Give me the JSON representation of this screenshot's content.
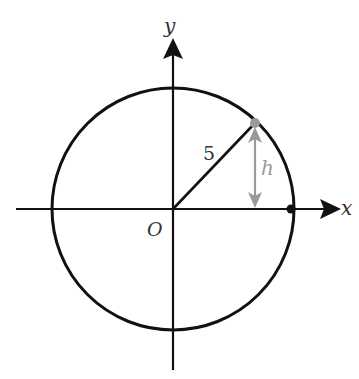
{
  "diagram": {
    "type": "unit-circle-height",
    "origin_label": "O",
    "x_axis_label": "x",
    "y_axis_label": "y",
    "radius_label": "5",
    "height_label": "h",
    "colors": {
      "stroke": "#111111",
      "highlight": "#999999",
      "background": "#ffffff"
    },
    "geometry": {
      "center": [
        173,
        209
      ],
      "radius_px": 121,
      "point_on_circle": [
        255,
        123
      ],
      "x_axis_intercept_point": [
        291,
        209
      ]
    }
  }
}
